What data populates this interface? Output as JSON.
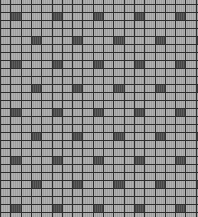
{
  "pattern": {
    "type": "checkered-grid",
    "width": 198,
    "height": 217,
    "col_width": 10.3,
    "row_height": 8,
    "row_offset": 4,
    "col_offset": 0,
    "cols": 20,
    "rows": 28,
    "colors": {
      "background": "#a9a9a9",
      "gridline": "#2e2e2e",
      "dark_cell": "#4e4e4e"
    },
    "dark_cells": {
      "row_period": 3,
      "row_start": 1,
      "col_period": 4,
      "col_start_even_band": 1,
      "col_start_odd_band": 3
    }
  }
}
